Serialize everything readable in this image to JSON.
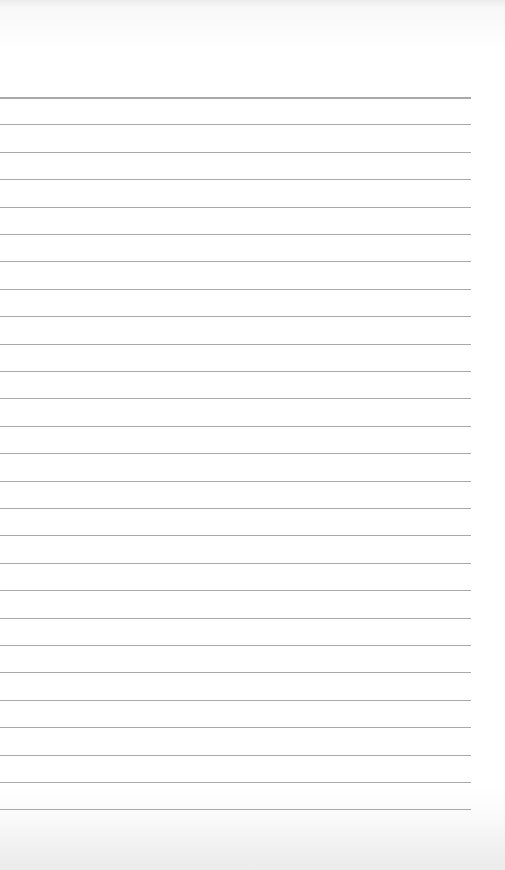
{
  "scene": {
    "subject": "blank lined paper",
    "background_color": "#ffffff",
    "line_color": "#a9a9a9"
  },
  "lines": {
    "first_y": 97,
    "spacing": 27.4,
    "count": 27,
    "width": 471
  }
}
